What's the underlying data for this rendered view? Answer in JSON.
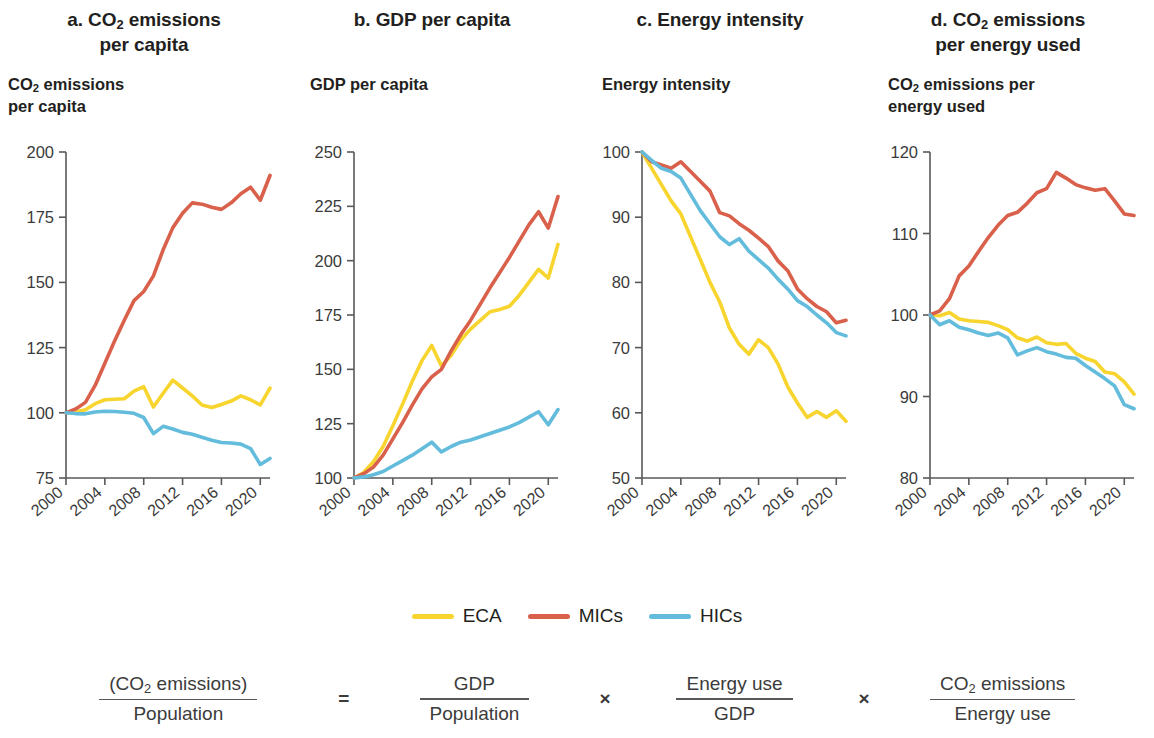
{
  "legend": {
    "items": [
      {
        "label": "ECA",
        "color": "#f7d52e"
      },
      {
        "label": "MICs",
        "color": "#d9604a"
      },
      {
        "label": "HICs",
        "color": "#63bcdc"
      }
    ]
  },
  "equation": {
    "lhs": {
      "num": "(CO₂ emissions)",
      "den": "Population"
    },
    "equals": "=",
    "t1": {
      "num": "GDP",
      "den": "Population"
    },
    "times1": "×",
    "t2": {
      "num": "Energy use",
      "den": "GDP"
    },
    "times2": "×",
    "t3": {
      "num": "CO₂ emissions",
      "den": "Energy use"
    }
  },
  "panels": [
    {
      "key": "a",
      "title_line1": "a. CO₂ emissions",
      "title_line2": "per capita",
      "axis_title_line1": "CO₂ emissions",
      "axis_title_line2": "per capita"
    },
    {
      "key": "b",
      "title_line1": "b. GDP per capita",
      "title_line2": "",
      "axis_title_line1": "GDP per capita",
      "axis_title_line2": ""
    },
    {
      "key": "c",
      "title_line1": "c. Energy intensity",
      "title_line2": "",
      "axis_title_line1": "Energy intensity",
      "axis_title_line2": ""
    },
    {
      "key": "d",
      "title_line1": "d. CO₂ emissions",
      "title_line2": "per energy used",
      "axis_title_line1": "CO₂ emissions per",
      "axis_title_line2": "energy used"
    }
  ],
  "chart_data": [
    {
      "type": "line",
      "panel": "a",
      "title": "a. CO2 emissions per capita",
      "ylabel": "CO2 emissions per capita",
      "xlabel": "",
      "grid": false,
      "legend_position": "bottom-shared",
      "xlim": [
        2000,
        2021
      ],
      "ylim": [
        75,
        200
      ],
      "yticks": [
        75,
        100,
        125,
        150,
        175,
        200
      ],
      "ytick_labels": [
        "75",
        "100",
        "125",
        "150",
        "175",
        "200"
      ],
      "xticks": [
        2000,
        2004,
        2008,
        2012,
        2016,
        2020
      ],
      "xtick_labels": [
        "2000",
        "2004",
        "2008",
        "2012",
        "2016",
        "2020"
      ],
      "x": [
        2000,
        2001,
        2002,
        2003,
        2004,
        2005,
        2006,
        2007,
        2008,
        2009,
        2010,
        2011,
        2012,
        2013,
        2014,
        2015,
        2016,
        2017,
        2018,
        2019,
        2020,
        2021
      ],
      "series": [
        {
          "name": "ECA",
          "color": "#f7d52e",
          "values": [
            100,
            100.3,
            101.2,
            103.5,
            105.0,
            105.2,
            105.4,
            108.3,
            110.0,
            102.2,
            107.5,
            112.5,
            109.5,
            106.5,
            103.0,
            102.0,
            103.2,
            104.5,
            106.5,
            105.0,
            103.0,
            109.5
          ]
        },
        {
          "name": "MICs",
          "color": "#d9604a",
          "values": [
            100,
            101.5,
            104.0,
            110.5,
            119.0,
            127.5,
            135.5,
            143.0,
            146.5,
            152.5,
            162.5,
            171.0,
            176.5,
            180.5,
            180.0,
            178.8,
            178.0,
            180.5,
            184.0,
            186.5,
            181.5,
            191.0
          ]
        },
        {
          "name": "HICs",
          "color": "#63bcdc",
          "values": [
            100,
            99.7,
            99.6,
            100.3,
            100.6,
            100.5,
            100.2,
            99.8,
            98.2,
            92.0,
            94.8,
            93.8,
            92.5,
            91.8,
            90.6,
            89.5,
            88.6,
            88.4,
            88.0,
            86.3,
            80.2,
            82.5
          ]
        }
      ]
    },
    {
      "type": "line",
      "panel": "b",
      "title": "b. GDP per capita",
      "ylabel": "GDP per capita",
      "xlabel": "",
      "grid": false,
      "legend_position": "bottom-shared",
      "xlim": [
        2000,
        2021
      ],
      "ylim": [
        100,
        250
      ],
      "yticks": [
        100,
        125,
        150,
        175,
        200,
        225,
        250
      ],
      "ytick_labels": [
        "100",
        "125",
        "150",
        "175",
        "200",
        "225",
        "250"
      ],
      "xticks": [
        2000,
        2004,
        2008,
        2012,
        2016,
        2020
      ],
      "xtick_labels": [
        "2000",
        "2004",
        "2008",
        "2012",
        "2016",
        "2020"
      ],
      "x": [
        2000,
        2001,
        2002,
        2003,
        2004,
        2005,
        2006,
        2007,
        2008,
        2009,
        2010,
        2011,
        2012,
        2013,
        2014,
        2015,
        2016,
        2017,
        2018,
        2019,
        2020,
        2021
      ],
      "series": [
        {
          "name": "ECA",
          "color": "#f7d52e",
          "values": [
            100,
            102.5,
            107.5,
            114.5,
            124.0,
            134.0,
            144.5,
            154.0,
            161.0,
            151.5,
            156.5,
            163.5,
            168.5,
            172.5,
            176.5,
            177.5,
            179.0,
            184.0,
            190.0,
            196.0,
            192.0,
            207.5
          ]
        },
        {
          "name": "MICs",
          "color": "#d9604a",
          "values": [
            100,
            102.0,
            105.0,
            110.5,
            118.0,
            125.5,
            133.5,
            141.0,
            146.5,
            150.0,
            158.5,
            166.0,
            172.5,
            180.0,
            187.5,
            194.5,
            201.5,
            209.0,
            216.5,
            222.5,
            215.0,
            229.5
          ]
        },
        {
          "name": "HICs",
          "color": "#63bcdc",
          "values": [
            100,
            100.5,
            101.5,
            103.0,
            105.5,
            108.0,
            110.5,
            113.5,
            116.5,
            112.0,
            114.5,
            116.5,
            117.5,
            119.0,
            120.5,
            122.0,
            123.5,
            125.5,
            128.0,
            130.5,
            124.5,
            131.5
          ]
        }
      ]
    },
    {
      "type": "line",
      "panel": "c",
      "title": "c. Energy intensity",
      "ylabel": "Energy intensity",
      "xlabel": "",
      "grid": false,
      "legend_position": "bottom-shared",
      "xlim": [
        2000,
        2021
      ],
      "ylim": [
        50,
        100
      ],
      "yticks": [
        50,
        60,
        70,
        80,
        90,
        100
      ],
      "ytick_labels": [
        "50",
        "60",
        "70",
        "80",
        "90",
        "100"
      ],
      "xticks": [
        2000,
        2004,
        2008,
        2012,
        2016,
        2020
      ],
      "xtick_labels": [
        "2000",
        "2004",
        "2008",
        "2012",
        "2016",
        "2020"
      ],
      "x": [
        2000,
        2001,
        2002,
        2003,
        2004,
        2005,
        2006,
        2007,
        2008,
        2009,
        2010,
        2011,
        2012,
        2013,
        2014,
        2015,
        2016,
        2017,
        2018,
        2019,
        2020,
        2021
      ],
      "series": [
        {
          "name": "ECA",
          "color": "#f7d52e",
          "values": [
            100,
            97.5,
            95.0,
            92.5,
            90.5,
            87.0,
            83.5,
            80.0,
            77.0,
            73.0,
            70.5,
            69.0,
            71.2,
            70.0,
            67.5,
            64.0,
            61.5,
            59.3,
            60.2,
            59.3,
            60.3,
            58.7
          ]
        },
        {
          "name": "MICs",
          "color": "#d9604a",
          "values": [
            100,
            98.5,
            98.0,
            97.5,
            98.5,
            97.0,
            95.5,
            94.0,
            90.7,
            90.2,
            89.0,
            88.0,
            86.8,
            85.5,
            83.3,
            81.8,
            79.0,
            77.5,
            76.3,
            75.5,
            73.8,
            74.2
          ]
        },
        {
          "name": "HICs",
          "color": "#63bcdc",
          "values": [
            100,
            98.7,
            97.5,
            97.0,
            96.0,
            93.5,
            91.0,
            89.0,
            87.0,
            85.8,
            86.7,
            84.8,
            83.5,
            82.2,
            80.5,
            79.0,
            77.2,
            76.3,
            75.0,
            73.8,
            72.3,
            71.8
          ]
        }
      ]
    },
    {
      "type": "line",
      "panel": "d",
      "title": "d. CO2 emissions per energy used",
      "ylabel": "CO2 emissions per energy used",
      "xlabel": "",
      "grid": false,
      "legend_position": "bottom-shared",
      "xlim": [
        2000,
        2021
      ],
      "ylim": [
        80,
        120
      ],
      "yticks": [
        80,
        90,
        100,
        110,
        120
      ],
      "ytick_labels": [
        "80",
        "90",
        "100",
        "110",
        "120"
      ],
      "xticks": [
        2000,
        2004,
        2008,
        2012,
        2016,
        2020
      ],
      "xtick_labels": [
        "2000",
        "2004",
        "2008",
        "2012",
        "2016",
        "2020"
      ],
      "x": [
        2000,
        2001,
        2002,
        2003,
        2004,
        2005,
        2006,
        2007,
        2008,
        2009,
        2010,
        2011,
        2012,
        2013,
        2014,
        2015,
        2016,
        2017,
        2018,
        2019,
        2020,
        2021
      ],
      "series": [
        {
          "name": "ECA",
          "color": "#f7d52e",
          "values": [
            100,
            99.9,
            100.3,
            99.5,
            99.3,
            99.2,
            99.1,
            98.7,
            98.2,
            97.2,
            96.8,
            97.3,
            96.6,
            96.4,
            96.5,
            95.3,
            94.7,
            94.3,
            93.0,
            92.8,
            91.8,
            90.3
          ]
        },
        {
          "name": "MICs",
          "color": "#d9604a",
          "values": [
            100,
            100.5,
            102.0,
            104.8,
            106.0,
            107.8,
            109.5,
            111.0,
            112.2,
            112.6,
            113.7,
            115.0,
            115.5,
            117.5,
            116.8,
            116.0,
            115.6,
            115.3,
            115.5,
            114.0,
            112.4,
            112.2
          ]
        },
        {
          "name": "HICs",
          "color": "#63bcdc",
          "values": [
            100,
            98.8,
            99.3,
            98.5,
            98.2,
            97.8,
            97.5,
            97.8,
            97.2,
            95.1,
            95.6,
            96.0,
            95.5,
            95.2,
            94.8,
            94.7,
            93.8,
            93.0,
            92.2,
            91.3,
            89.0,
            88.5
          ]
        }
      ]
    }
  ]
}
